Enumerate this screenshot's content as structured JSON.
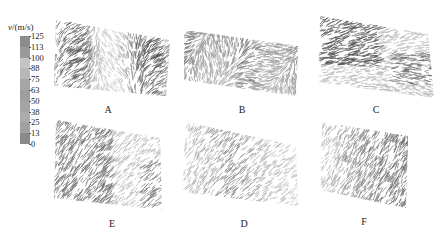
{
  "legend": {
    "title_var": "v",
    "title_unit": "/(m/s)",
    "ticks": [
      "125",
      "113",
      "100",
      "88",
      "75",
      "63",
      "50",
      "38",
      "25",
      "13",
      "0"
    ],
    "colors": [
      "#8c8c8c",
      "#9a9a9a",
      "#c4c4c4",
      "#b8b8b8",
      "#a6a6a6",
      "#9e9e9e",
      "#a4a4a4",
      "#acacac",
      "#a0a0a0",
      "#8a8a8a"
    ]
  },
  "panels": [
    {
      "label": "A",
      "density": "high",
      "tone": "#6a6a6a"
    },
    {
      "label": "B",
      "density": "high",
      "tone": "#5a5a5a"
    },
    {
      "label": "C",
      "density": "medium",
      "tone": "#707070"
    },
    {
      "label": "E",
      "density": "medium",
      "tone": "#6e6e6e"
    },
    {
      "label": "D",
      "density": "low",
      "tone": "#8a8a8a"
    },
    {
      "label": "F",
      "density": "medium",
      "tone": "#7a7a7a"
    }
  ],
  "chart_data": {
    "type": "heatmap",
    "title": "",
    "colorbar": {
      "label": "v/(m/s)",
      "range": [
        0,
        125
      ],
      "ticks": [
        125,
        113,
        100,
        88,
        75,
        63,
        50,
        38,
        25,
        13,
        0
      ]
    },
    "panels": [
      "A",
      "B",
      "C",
      "E",
      "D",
      "F"
    ],
    "layout": {
      "rows": 2,
      "cols": 3,
      "order": [
        [
          "A",
          "B",
          "C"
        ],
        [
          "E",
          "D",
          "F"
        ]
      ]
    }
  }
}
